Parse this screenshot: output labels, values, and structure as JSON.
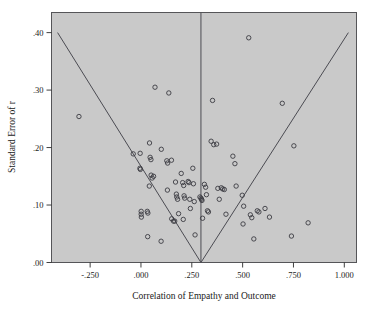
{
  "figure": {
    "type": "scatter",
    "background_color": "#ffffff",
    "plot_area_color": "#c9c9c9",
    "marker_color": "#3b3b42",
    "line_color": "#4b4b52"
  },
  "chart_data": {
    "type": "scatter",
    "title": "",
    "subtitle": "",
    "xlabel": "Correlation of Empathy and Outcome",
    "ylabel": "Standard Error of r",
    "xlim": [
      -0.44,
      1.06
    ],
    "ylim": [
      0.0,
      0.435
    ],
    "grid": false,
    "legend": null,
    "xticks": [
      -0.25,
      0.0,
      0.25,
      0.5,
      0.75,
      1.0
    ],
    "xtick_labels": [
      "-.250",
      ".000",
      ".250",
      ".500",
      ".750",
      "1.000"
    ],
    "yticks": [
      0.0,
      0.1,
      0.2,
      0.3,
      0.4
    ],
    "ytick_labels": [
      ".00",
      ".10",
      ".20",
      ".30",
      ".40"
    ],
    "annotations": [
      {
        "name": "vertical-reference-line",
        "type": "vline",
        "x": 0.295,
        "y_from": 0.0,
        "y_to": 0.435
      },
      {
        "name": "funnel-left-limit",
        "type": "line",
        "x_from": 0.295,
        "y_from": 0.0,
        "x_to": -0.41,
        "y_to": 0.4
      },
      {
        "name": "funnel-right-limit",
        "type": "line",
        "x_from": 0.295,
        "y_from": 0.0,
        "x_to": 1.02,
        "y_to": 0.4
      }
    ],
    "series": [
      {
        "name": "Studies",
        "marker": "circle-open",
        "points": [
          [
            -0.305,
            0.254
          ],
          [
            -0.038,
            0.189
          ],
          [
            -0.004,
            0.19
          ],
          [
            -0.005,
            0.164
          ],
          [
            -0.003,
            0.162
          ],
          [
            0.001,
            0.089
          ],
          [
            0.001,
            0.084
          ],
          [
            0.002,
            0.079
          ],
          [
            0.031,
            0.089
          ],
          [
            0.034,
            0.086
          ],
          [
            0.042,
            0.208
          ],
          [
            0.045,
            0.183
          ],
          [
            0.049,
            0.179
          ],
          [
            0.05,
            0.152
          ],
          [
            0.055,
            0.147
          ],
          [
            0.062,
            0.15
          ],
          [
            0.069,
            0.305
          ],
          [
            0.041,
            0.133
          ],
          [
            0.033,
            0.045
          ],
          [
            0.099,
            0.037
          ],
          [
            0.1,
            0.197
          ],
          [
            0.127,
            0.177
          ],
          [
            0.131,
            0.173
          ],
          [
            0.137,
            0.295
          ],
          [
            0.13,
            0.126
          ],
          [
            0.151,
            0.076
          ],
          [
            0.16,
            0.072
          ],
          [
            0.166,
            0.072
          ],
          [
            0.15,
            0.178
          ],
          [
            0.17,
            0.14
          ],
          [
            0.174,
            0.119
          ],
          [
            0.176,
            0.114
          ],
          [
            0.18,
            0.11
          ],
          [
            0.185,
            0.085
          ],
          [
            0.198,
            0.155
          ],
          [
            0.205,
            0.139
          ],
          [
            0.21,
            0.134
          ],
          [
            0.212,
            0.116
          ],
          [
            0.215,
            0.112
          ],
          [
            0.208,
            0.075
          ],
          [
            0.232,
            0.141
          ],
          [
            0.236,
            0.139
          ],
          [
            0.24,
            0.11
          ],
          [
            0.243,
            0.094
          ],
          [
            0.255,
            0.164
          ],
          [
            0.258,
            0.137
          ],
          [
            0.262,
            0.106
          ],
          [
            0.266,
            0.048
          ],
          [
            0.29,
            0.114
          ],
          [
            0.295,
            0.112
          ],
          [
            0.298,
            0.11
          ],
          [
            0.3,
            0.108
          ],
          [
            0.303,
            0.077
          ],
          [
            0.312,
            0.136
          ],
          [
            0.318,
            0.131
          ],
          [
            0.322,
            0.118
          ],
          [
            0.327,
            0.09
          ],
          [
            0.332,
            0.088
          ],
          [
            0.345,
            0.211
          ],
          [
            0.352,
            0.282
          ],
          [
            0.358,
            0.205
          ],
          [
            0.372,
            0.206
          ],
          [
            0.378,
            0.129
          ],
          [
            0.385,
            0.11
          ],
          [
            0.395,
            0.13
          ],
          [
            0.402,
            0.128
          ],
          [
            0.41,
            0.127
          ],
          [
            0.418,
            0.084
          ],
          [
            0.452,
            0.185
          ],
          [
            0.462,
            0.172
          ],
          [
            0.468,
            0.133
          ],
          [
            0.498,
            0.117
          ],
          [
            0.505,
            0.098
          ],
          [
            0.502,
            0.067
          ],
          [
            0.53,
            0.391
          ],
          [
            0.538,
            0.083
          ],
          [
            0.545,
            0.078
          ],
          [
            0.555,
            0.041
          ],
          [
            0.572,
            0.09
          ],
          [
            0.58,
            0.088
          ],
          [
            0.61,
            0.094
          ],
          [
            0.632,
            0.079
          ],
          [
            0.695,
            0.277
          ],
          [
            0.74,
            0.046
          ],
          [
            0.752,
            0.203
          ],
          [
            0.822,
            0.069
          ]
        ]
      }
    ]
  }
}
